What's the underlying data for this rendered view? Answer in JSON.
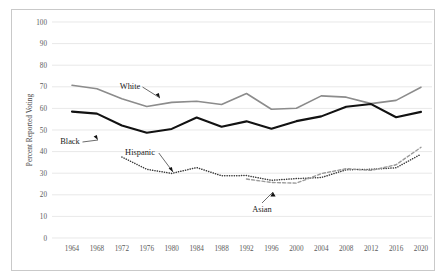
{
  "figure": {
    "border_color": "#c9c9c9",
    "background": "#ffffff"
  },
  "chart_data": {
    "type": "line",
    "title": "",
    "xlabel": "",
    "ylabel": "Percent Reported Voting",
    "ylim": [
      0,
      100
    ],
    "ytick_step": 10,
    "yticks": [
      "0",
      "10",
      "20",
      "30",
      "40",
      "50",
      "60",
      "70",
      "80",
      "90",
      "100"
    ],
    "grid": true,
    "grid_axis": "y",
    "legend": "inline-annotations",
    "x": [
      1964,
      1968,
      1972,
      1976,
      1980,
      1984,
      1988,
      1992,
      1996,
      2000,
      2004,
      2008,
      2012,
      2016,
      2020
    ],
    "categories": [
      "1964",
      "1968",
      "1972",
      "1976",
      "1980",
      "1984",
      "1988",
      "1992",
      "1996",
      "2000",
      "2004",
      "2008",
      "2012",
      "2016",
      "2020"
    ],
    "series": [
      {
        "name": "White",
        "color": "#8c8c8c",
        "style": "solid",
        "width": 1.6,
        "values": [
          70.7,
          69.1,
          64.5,
          60.9,
          62.8,
          63.3,
          61.8,
          66.9,
          59.6,
          60.1,
          65.8,
          65.2,
          62.2,
          63.7,
          69.8
        ]
      },
      {
        "name": "Black",
        "color": "#121212",
        "style": "solid",
        "width": 2.1,
        "values": [
          58.5,
          57.6,
          52.1,
          48.7,
          50.5,
          55.8,
          51.5,
          54.0,
          50.6,
          54.1,
          56.3,
          60.8,
          62.0,
          55.9,
          58.4
        ]
      },
      {
        "name": "Hispanic",
        "color": "#3a3a3a",
        "style": "dotted",
        "width": 1.5,
        "start_year": 1972,
        "values": [
          null,
          null,
          37.5,
          31.8,
          29.9,
          32.6,
          28.8,
          28.9,
          26.7,
          27.5,
          28.0,
          31.6,
          31.8,
          32.5,
          38.8
        ]
      },
      {
        "name": "Asian",
        "color": "#9a9a9a",
        "style": "dashed",
        "width": 1.4,
        "start_year": 1990,
        "values": [
          null,
          null,
          null,
          null,
          null,
          null,
          null,
          27.3,
          25.7,
          25.4,
          29.8,
          32.1,
          31.3,
          33.9,
          42.0
        ]
      }
    ],
    "annotations": [
      {
        "text": "White",
        "label_x": 130,
        "label_y": 89,
        "arrow_to_x": 160,
        "arrow_to_y": 98,
        "arrow_dir": "down-right"
      },
      {
        "text": "Black",
        "label_x": 70,
        "label_y": 144,
        "arrow_to_x": 98,
        "arrow_to_y": 140,
        "arrow_dir": "down-right"
      },
      {
        "text": "Hispanic",
        "label_x": 140,
        "label_y": 155,
        "arrow_to_x": 173,
        "arrow_to_y": 172,
        "arrow_dir": "down-right"
      },
      {
        "text": "Asian",
        "label_x": 262,
        "label_y": 212,
        "arrow_to_x": 273,
        "arrow_to_y": 192,
        "arrow_dir": "up"
      }
    ]
  }
}
